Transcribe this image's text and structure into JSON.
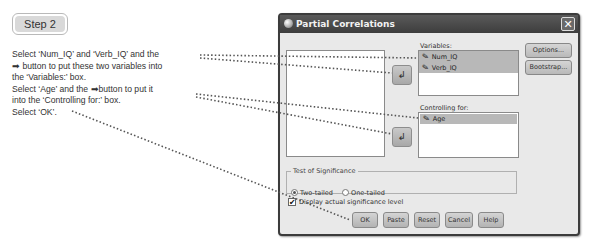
{
  "step_badge": "Step 2",
  "instructions": {
    "line1": "Select ‘Num_IQ’ and ‘Verb_IQ’ and the",
    "line2_icon": "➡",
    "line2": " button to put these two variables into",
    "line3": "the ‘Variables:’ box.",
    "line4a": "Select ‘Age’ and the ",
    "line4_icon": "➡",
    "line4b": "button to put it",
    "line5": "into the ‘Controlling for:’ box.",
    "line6": "Select ‘OK’."
  },
  "dialog": {
    "title": "Partial Correlations",
    "close_glyph": "✕",
    "variables_label": "Variables:",
    "variables": [
      {
        "name": "Num_IQ",
        "selected": true,
        "icon": "scale-variable-icon"
      },
      {
        "name": "Verb_IQ",
        "selected": true,
        "icon": "scale-variable-icon"
      }
    ],
    "controlling_label": "Controlling for:",
    "controlling": [
      {
        "name": "Age",
        "selected": true,
        "icon": "scale-variable-icon"
      }
    ],
    "arrow_glyph": "↲",
    "options_button": "Options...",
    "bootstrap_button": "Bootstrap...",
    "test_group_label": "Test of Significance",
    "radio_two_tailed": "Two-tailed",
    "radio_one_tailed": "One-tailed",
    "two_tailed_selected": true,
    "display_checkbox": "Display actual significance level",
    "display_checked": true,
    "check_glyph": "✔",
    "buttons": {
      "ok": "OK",
      "paste": "Paste",
      "reset": "Reset",
      "cancel": "Cancel",
      "help": "Help"
    }
  },
  "var_icon_glyph": "✎"
}
